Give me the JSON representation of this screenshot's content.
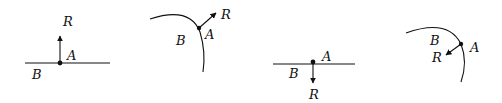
{
  "figure": {
    "stroke_color": "#111111",
    "background": "#ffffff",
    "panels": [
      {
        "id": "flat-up",
        "surface": "flat",
        "reaction_direction": "up",
        "labels": {
          "reaction": "R",
          "point": "A",
          "surface": "B"
        }
      },
      {
        "id": "curved-out",
        "surface": "curved",
        "reaction_direction": "outward",
        "labels": {
          "reaction": "R",
          "point": "A",
          "surface": "B"
        }
      },
      {
        "id": "flat-down",
        "surface": "flat",
        "reaction_direction": "down",
        "labels": {
          "reaction": "R",
          "point": "A",
          "surface": "B"
        }
      },
      {
        "id": "curved-in",
        "surface": "curved",
        "reaction_direction": "inward",
        "labels": {
          "reaction": "R",
          "point": "A",
          "surface": "B"
        }
      }
    ]
  }
}
